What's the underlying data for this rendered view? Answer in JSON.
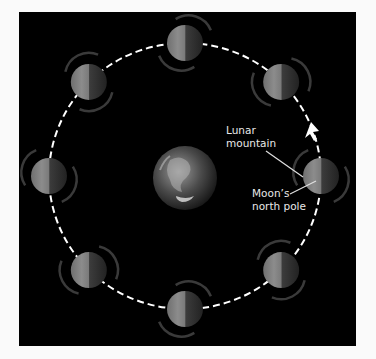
{
  "diagram": {
    "title": "",
    "labels": {
      "lunar_mountain": [
        "Lunar",
        "mountain"
      ],
      "north_pole": [
        "Moon’s",
        "north pole"
      ]
    },
    "orbit_direction": "counterclockwise",
    "moon_count": 8,
    "central_body": "earth",
    "colors": {
      "background": "#000000",
      "orbit_line": "#ffffff",
      "label_text": "#e8e8e8",
      "moon_lit": "#8a8a8a",
      "moon_dark": "#2a2a2a"
    }
  }
}
